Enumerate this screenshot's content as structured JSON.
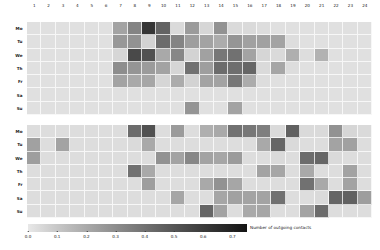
{
  "figure": {
    "title": "",
    "background": "#ffffff"
  },
  "colorbar": {
    "label": "Number of outgoing contacts",
    "ticks": [
      "0.0",
      "0.1",
      "0.2",
      "0.3",
      "0.4",
      "0.5",
      "0.6",
      "0.7"
    ],
    "low_color": "#e3e3e3",
    "high_color": "#1a1a1a",
    "orientation": "horizontal"
  },
  "chart_data": {
    "type": "heatmap",
    "title": "",
    "xlabel": "",
    "ylabel": "",
    "colorbar_label": "Number of outgoing contacts",
    "colormap": "greys",
    "vmin": 0.0,
    "vmax": 0.75,
    "cbar_ticks": [
      0.0,
      0.1,
      0.2,
      0.3,
      0.4,
      0.5,
      0.6,
      0.7
    ],
    "x_categories": [
      "1",
      "2",
      "3",
      "4",
      "5",
      "6",
      "7",
      "8",
      "9",
      "10",
      "11",
      "12",
      "13",
      "14",
      "15",
      "16",
      "17",
      "18",
      "19",
      "20",
      "21",
      "22",
      "23",
      "24"
    ],
    "y_categories": [
      "Mo",
      "Tu",
      "We",
      "Th",
      "Fr",
      "Sa",
      "Su"
    ],
    "panels": [
      {
        "name": "upper-heatmap",
        "rows": [
          "Mo",
          "Tu",
          "We",
          "Th",
          "Fr",
          "Sa",
          "Su"
        ],
        "values": [
          [
            0.02,
            0.02,
            0.02,
            0.02,
            0.02,
            0.02,
            0.22,
            0.33,
            0.62,
            0.45,
            0.04,
            0.25,
            0.05,
            0.28,
            0.04,
            0.04,
            0.03,
            0.02,
            0.02,
            0.02,
            0.02,
            0.02,
            0.02,
            0.02
          ],
          [
            0.02,
            0.02,
            0.02,
            0.02,
            0.02,
            0.02,
            0.26,
            0.28,
            0.06,
            0.42,
            0.33,
            0.24,
            0.22,
            0.19,
            0.27,
            0.23,
            0.23,
            0.22,
            0.03,
            0.02,
            0.02,
            0.02,
            0.02,
            0.02
          ],
          [
            0.02,
            0.02,
            0.02,
            0.02,
            0.02,
            0.02,
            0.05,
            0.55,
            0.52,
            0.2,
            0.32,
            0.06,
            0.23,
            0.38,
            0.4,
            0.22,
            0.05,
            0.04,
            0.18,
            0.03,
            0.17,
            0.02,
            0.02,
            0.02
          ],
          [
            0.02,
            0.02,
            0.02,
            0.02,
            0.02,
            0.02,
            0.3,
            0.27,
            0.25,
            0.22,
            0.05,
            0.4,
            0.24,
            0.42,
            0.41,
            0.44,
            0.04,
            0.21,
            0.03,
            0.02,
            0.02,
            0.02,
            0.02,
            0.02
          ],
          [
            0.02,
            0.02,
            0.02,
            0.02,
            0.02,
            0.02,
            0.22,
            0.2,
            0.21,
            0.05,
            0.19,
            0.06,
            0.22,
            0.22,
            0.38,
            0.19,
            0.03,
            0.02,
            0.02,
            0.02,
            0.02,
            0.02,
            0.02,
            0.02
          ],
          [
            0.02,
            0.02,
            0.02,
            0.02,
            0.02,
            0.02,
            0.02,
            0.02,
            0.02,
            0.02,
            0.02,
            0.02,
            0.02,
            0.02,
            0.02,
            0.02,
            0.02,
            0.02,
            0.02,
            0.02,
            0.02,
            0.02,
            0.02,
            0.02
          ],
          [
            0.02,
            0.02,
            0.02,
            0.02,
            0.02,
            0.02,
            0.02,
            0.02,
            0.02,
            0.02,
            0.02,
            0.27,
            0.02,
            0.02,
            0.22,
            0.02,
            0.02,
            0.02,
            0.02,
            0.02,
            0.02,
            0.02,
            0.02,
            0.02
          ]
        ]
      },
      {
        "name": "lower-heatmap",
        "rows": [
          "Mo",
          "Tu",
          "We",
          "Th",
          "Fr",
          "Sa",
          "Su"
        ],
        "values": [
          [
            0.03,
            0.03,
            0.03,
            0.03,
            0.03,
            0.03,
            0.03,
            0.42,
            0.52,
            0.03,
            0.25,
            0.03,
            0.18,
            0.2,
            0.4,
            0.38,
            0.35,
            0.04,
            0.46,
            0.04,
            0.04,
            0.28,
            0.05,
            0.04
          ],
          [
            0.23,
            0.03,
            0.22,
            0.03,
            0.03,
            0.03,
            0.03,
            0.04,
            0.2,
            0.03,
            0.03,
            0.03,
            0.03,
            0.03,
            0.03,
            0.03,
            0.2,
            0.44,
            0.04,
            0.03,
            0.03,
            0.22,
            0.23,
            0.03
          ],
          [
            0.24,
            0.03,
            0.03,
            0.03,
            0.03,
            0.03,
            0.03,
            0.03,
            0.03,
            0.28,
            0.22,
            0.32,
            0.22,
            0.21,
            0.25,
            0.03,
            0.03,
            0.04,
            0.03,
            0.42,
            0.44,
            0.04,
            0.03,
            0.03
          ],
          [
            0.03,
            0.03,
            0.03,
            0.03,
            0.03,
            0.03,
            0.03,
            0.4,
            0.2,
            0.03,
            0.03,
            0.03,
            0.03,
            0.03,
            0.03,
            0.03,
            0.22,
            0.21,
            0.03,
            0.2,
            0.03,
            0.03,
            0.22,
            0.03
          ],
          [
            0.03,
            0.03,
            0.03,
            0.03,
            0.03,
            0.03,
            0.03,
            0.03,
            0.24,
            0.03,
            0.03,
            0.03,
            0.2,
            0.28,
            0.21,
            0.03,
            0.03,
            0.03,
            0.03,
            0.4,
            0.2,
            0.03,
            0.22,
            0.03
          ],
          [
            0.03,
            0.03,
            0.03,
            0.03,
            0.03,
            0.03,
            0.03,
            0.03,
            0.03,
            0.03,
            0.21,
            0.03,
            0.03,
            0.21,
            0.23,
            0.22,
            0.22,
            0.4,
            0.03,
            0.03,
            0.04,
            0.44,
            0.46,
            0.24
          ],
          [
            0.03,
            0.03,
            0.03,
            0.03,
            0.03,
            0.03,
            0.03,
            0.03,
            0.03,
            0.03,
            0.03,
            0.03,
            0.44,
            0.22,
            0.03,
            0.2,
            0.21,
            0.03,
            0.03,
            0.22,
            0.42,
            0.03,
            0.03,
            0.03
          ]
        ]
      }
    ]
  }
}
